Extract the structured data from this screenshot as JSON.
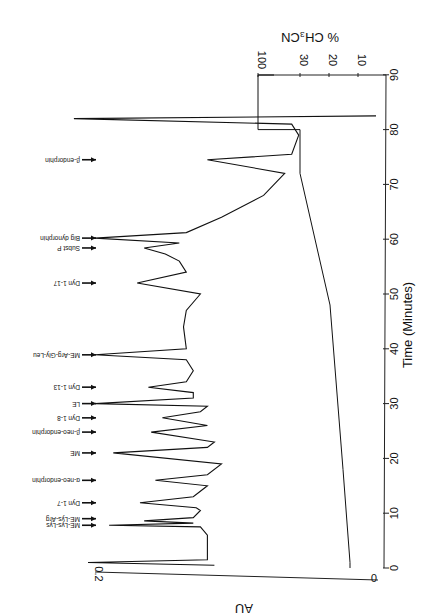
{
  "chart_data": {
    "type": "line",
    "title": "",
    "orientation": "figure printed rotated 180 degrees (time axis vertical, labels upside-down)",
    "xlabel": "Time (Minutes)",
    "ylabel": "AU",
    "y2label": "% CH3CN",
    "xlim": [
      0,
      90
    ],
    "ylim": [
      0,
      0.2
    ],
    "y2_ticks": [
      "10",
      "20",
      "30",
      "100"
    ],
    "x_ticks": [
      "0",
      "10",
      "20",
      "30",
      "40",
      "50",
      "60",
      "70",
      "80",
      "90"
    ],
    "y_ticks": [
      "0",
      "0.2"
    ],
    "grid": false,
    "series": [
      {
        "name": "Absorbance (AU)",
        "points": [
          [
            0.5,
            0.115
          ],
          [
            1.0,
            0.205
          ],
          [
            1.5,
            0.12
          ],
          [
            3,
            0.12
          ],
          [
            6,
            0.12
          ],
          [
            7.5,
            0.125
          ],
          [
            7.8,
            0.19
          ],
          [
            8.2,
            0.13
          ],
          [
            8.6,
            0.165
          ],
          [
            9.2,
            0.13
          ],
          [
            10.5,
            0.125
          ],
          [
            11.0,
            0.128
          ],
          [
            11.9,
            0.168
          ],
          [
            13,
            0.13
          ],
          [
            15,
            0.12
          ],
          [
            16,
            0.157
          ],
          [
            17,
            0.12
          ],
          [
            19,
            0.11
          ],
          [
            21,
            0.187
          ],
          [
            22,
            0.12
          ],
          [
            23,
            0.115
          ],
          [
            24.8,
            0.16
          ],
          [
            26,
            0.12
          ],
          [
            27.4,
            0.152
          ],
          [
            28.5,
            0.125
          ],
          [
            29.5,
            0.12
          ],
          [
            30,
            0.2
          ],
          [
            31,
            0.13
          ],
          [
            32,
            0.13
          ],
          [
            33,
            0.162
          ],
          [
            34,
            0.135
          ],
          [
            36,
            0.13
          ],
          [
            38,
            0.135
          ],
          [
            38.9,
            0.2
          ],
          [
            40,
            0.135
          ],
          [
            44,
            0.137
          ],
          [
            47,
            0.135
          ],
          [
            50,
            0.125
          ],
          [
            52,
            0.17
          ],
          [
            54,
            0.135
          ],
          [
            56,
            0.14
          ],
          [
            57.3,
            0.15
          ],
          [
            58.4,
            0.165
          ],
          [
            59.3,
            0.14
          ],
          [
            60.2,
            0.2
          ],
          [
            61.2,
            0.135
          ],
          [
            64,
            0.11
          ],
          [
            68,
            0.08
          ],
          [
            72,
            0.065
          ],
          [
            74.5,
            0.12
          ],
          [
            75.5,
            0.06
          ],
          [
            79,
            0.055
          ],
          [
            81,
            0.06
          ],
          [
            82,
            0.215
          ],
          [
            82.5,
            0.0
          ]
        ]
      },
      {
        "name": "% CH3CN gradient",
        "points": [
          [
            0,
            5
          ],
          [
            1,
            5
          ],
          [
            18,
            10
          ],
          [
            48,
            20
          ],
          [
            72,
            30
          ],
          [
            80,
            30
          ],
          [
            80,
            100
          ],
          [
            90,
            100
          ]
        ]
      }
    ],
    "annotations": [
      {
        "label": "ME-Lys-Lys",
        "time": 7.8
      },
      {
        "label": "ME-Lys-Arg",
        "time": 9.0
      },
      {
        "label": "Dyn 1-7",
        "time": 11.9
      },
      {
        "label": "α-neo-endorphin",
        "time": 16.0
      },
      {
        "label": "ME",
        "time": 21.0
      },
      {
        "label": "β-neo-endorphin",
        "time": 24.8
      },
      {
        "label": "Dyn 1-8",
        "time": 27.4
      },
      {
        "label": "LE",
        "time": 30.0
      },
      {
        "label": "Dyn 1-13",
        "time": 33.0
      },
      {
        "label": "ME-Arg-Gly-Leu",
        "time": 38.9
      },
      {
        "label": "Dyn 1-17",
        "time": 52.0
      },
      {
        "label": "Subst P",
        "time": 58.4
      },
      {
        "label": "Big dynorphin",
        "time": 60.2
      },
      {
        "label": "β-endorphin",
        "time": 74.5
      }
    ]
  },
  "labels": {
    "time_axis": "Time (Minutes)",
    "au_axis": "AU",
    "ch3cn_axis": "% CH₃CN",
    "au_zero": "0",
    "au_top": "0.2",
    "time_ticks": [
      "0",
      "10",
      "20",
      "30",
      "40",
      "50",
      "60",
      "70",
      "80",
      "90"
    ],
    "ch3cn_ticks": [
      "100",
      "30",
      "20",
      "10"
    ]
  }
}
